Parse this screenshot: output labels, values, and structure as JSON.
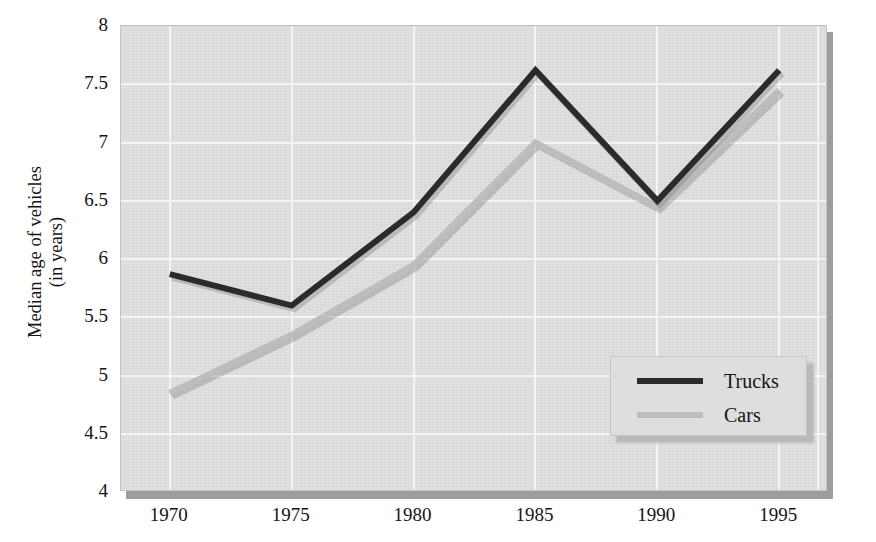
{
  "chart_data": {
    "type": "line",
    "title": "",
    "xlabel": "",
    "ylabel": "Median age of vehicles (in years)",
    "ylabel_line1": "Median age of vehicles",
    "ylabel_line2": "(in years)",
    "categories": [
      "1970",
      "1975",
      "1980",
      "1985",
      "1990",
      "1995"
    ],
    "x": [
      1970,
      1975,
      1980,
      1985,
      1990,
      1995
    ],
    "xlim": [
      1968,
      1997
    ],
    "ylim": [
      4,
      8
    ],
    "yticks": [
      4,
      4.5,
      5,
      5.5,
      6,
      6.5,
      7,
      7.5,
      8
    ],
    "ytick_labels": [
      "4",
      "4.5",
      "5",
      "5.5",
      "6",
      "6.5",
      "7",
      "7.5",
      "8"
    ],
    "grid": true,
    "legend_position": "inside-bottom-right",
    "series": [
      {
        "name": "Trucks",
        "color": "#2b2b2b",
        "values": [
          5.87,
          5.6,
          6.4,
          7.62,
          6.5,
          7.62
        ]
      },
      {
        "name": "Cars",
        "color": "#bdbdbd",
        "values": [
          4.85,
          5.35,
          5.95,
          7.0,
          6.45,
          7.45
        ]
      }
    ]
  },
  "legend": {
    "items": [
      {
        "label": "Trucks",
        "color": "#2b2b2b"
      },
      {
        "label": "Cars",
        "color": "#bdbdbd"
      }
    ]
  },
  "colors": {
    "plot_background": "#dcdcdc",
    "gridline": "#f4f4f4",
    "trucks": "#2b2b2b",
    "cars": "#bdbdbd",
    "text": "#141414",
    "page_background": "#ffffff"
  }
}
